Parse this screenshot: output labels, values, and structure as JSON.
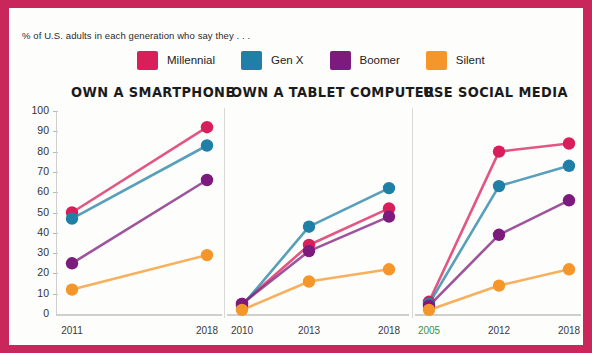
{
  "subtitle": "% of U.S. adults in each generation who say they . . .",
  "legend": [
    {
      "label": "Millennial",
      "color": "#d81f5a"
    },
    {
      "label": "Gen X",
      "color": "#1f7fa6"
    },
    {
      "label": "Boomer",
      "color": "#7d1a7d"
    },
    {
      "label": "Silent",
      "color": "#f5962b"
    }
  ],
  "yaxis": {
    "ticks": [
      "100",
      "90",
      "80",
      "70",
      "60",
      "50",
      "40",
      "30",
      "20",
      "10",
      "0"
    ]
  },
  "panels": [
    {
      "title": "OWN A SMARTPHONE",
      "xticks": [
        "2011",
        "2018"
      ]
    },
    {
      "title": "OWN A TABLET COMPUTER",
      "xticks": [
        "2010",
        "2013",
        "2018"
      ]
    },
    {
      "title": "USE SOCIAL MEDIA",
      "xticks": [
        "2005",
        "2012",
        "2018"
      ]
    }
  ],
  "colors": {
    "border": "#c9265c",
    "panel_bg": "#fdfdfb",
    "axis": "#cfcfcf",
    "highlight_tick": "#3f8f3f"
  },
  "chart_data": [
    {
      "type": "line",
      "title": "OWN A SMARTPHONE",
      "xlabel": "",
      "ylabel": "",
      "ylim": [
        0,
        100
      ],
      "grid": false,
      "legend_position": "top",
      "x": [
        "2011",
        "2018"
      ],
      "series": [
        {
          "name": "Millennial",
          "color": "#d81f5a",
          "values": [
            50,
            92
          ]
        },
        {
          "name": "Gen X",
          "color": "#1f7fa6",
          "values": [
            47,
            83
          ]
        },
        {
          "name": "Boomer",
          "color": "#7d1a7d",
          "values": [
            25,
            66
          ]
        },
        {
          "name": "Silent",
          "color": "#f5962b",
          "values": [
            12,
            29
          ]
        }
      ]
    },
    {
      "type": "line",
      "title": "OWN A TABLET COMPUTER",
      "xlabel": "",
      "ylabel": "",
      "ylim": [
        0,
        100
      ],
      "grid": false,
      "legend_position": "top",
      "x": [
        "2010",
        "2013",
        "2018"
      ],
      "series": [
        {
          "name": "Millennial",
          "color": "#d81f5a",
          "values": [
            5,
            34,
            52
          ]
        },
        {
          "name": "Gen X",
          "color": "#1f7fa6",
          "values": [
            4,
            43,
            62
          ]
        },
        {
          "name": "Boomer",
          "color": "#7d1a7d",
          "values": [
            5,
            31,
            48
          ]
        },
        {
          "name": "Silent",
          "color": "#f5962b",
          "values": [
            2,
            16,
            22
          ]
        }
      ]
    },
    {
      "type": "line",
      "title": "USE SOCIAL MEDIA",
      "xlabel": "",
      "ylabel": "",
      "ylim": [
        0,
        100
      ],
      "grid": false,
      "legend_position": "top",
      "x": [
        "2005",
        "2012",
        "2018"
      ],
      "series": [
        {
          "name": "Millennial",
          "color": "#d81f5a",
          "values": [
            6,
            80,
            84
          ]
        },
        {
          "name": "Gen X",
          "color": "#1f7fa6",
          "values": [
            5,
            63,
            73
          ]
        },
        {
          "name": "Boomer",
          "color": "#7d1a7d",
          "values": [
            4,
            39,
            56
          ]
        },
        {
          "name": "Silent",
          "color": "#f5962b",
          "values": [
            2,
            14,
            22
          ]
        }
      ]
    }
  ]
}
